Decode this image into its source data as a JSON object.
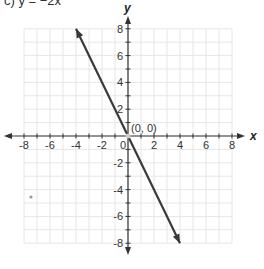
{
  "title": "c) y = −2x",
  "chart_data": {
    "type": "line",
    "title": "c) y = −2x",
    "xlabel": "x",
    "ylabel": "y",
    "xlim": [
      -8,
      8
    ],
    "ylim": [
      -8,
      8
    ],
    "grid": true,
    "x_ticks": [
      -8,
      -6,
      -4,
      -2,
      0,
      2,
      4,
      6,
      8
    ],
    "y_ticks": [
      -8,
      -6,
      -4,
      -2,
      2,
      4,
      6,
      8
    ],
    "x_tick_labels": [
      "-8",
      "-6",
      "-4",
      "-2",
      "0",
      "2",
      "4",
      "6",
      "8"
    ],
    "y_tick_labels": [
      "-8",
      "-6",
      "-4",
      "-2",
      "2",
      "4",
      "6",
      "8"
    ],
    "series": [
      {
        "name": "y = -2x",
        "equation": "y = -2x",
        "slope": -2,
        "intercept": 0,
        "x": [
          -4,
          4
        ],
        "y": [
          8,
          -8
        ],
        "arrows_both_ends": true,
        "color": "#3a3a3a"
      }
    ],
    "annotations": [
      {
        "text": "(0, 0)",
        "x": 0,
        "y": 0
      }
    ]
  },
  "colors": {
    "grid": "#e6e6e6",
    "axis": "#333333",
    "line": "#3a3a3a"
  }
}
